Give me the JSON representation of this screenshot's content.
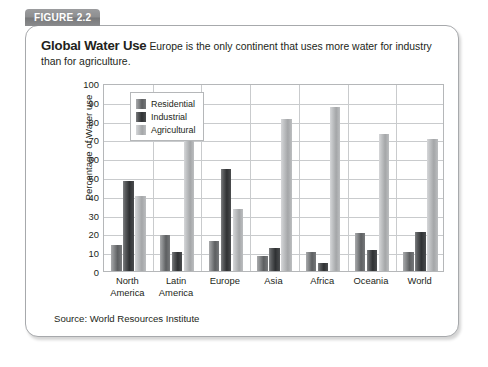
{
  "figure": {
    "tab_label": "FIGURE 2.2",
    "title": "Global Water Use",
    "description": "Europe is the only continent that uses more water for industry than for agriculture.",
    "source": "Source: World Resources Institute"
  },
  "colors": {
    "residential": "#6d6f71",
    "industrial": "#3a3c3e",
    "agricultural": "#b8babc",
    "card_border": "#a7a9ac",
    "tab_background": "#8a8b8d",
    "gridline": "#c9cbcd",
    "text": "#231f20"
  },
  "chart_data": {
    "type": "bar",
    "title": "Global Water Use",
    "xlabel": "",
    "ylabel": "Percentage of Water use",
    "ylim": [
      0,
      100
    ],
    "yticks": [
      0,
      10,
      20,
      30,
      40,
      50,
      60,
      70,
      80,
      90,
      100
    ],
    "grid": true,
    "legend_position": "top-left inside plot",
    "categories": [
      "North America",
      "Latin America",
      "Europe",
      "Asia",
      "Africa",
      "Oceania",
      "World"
    ],
    "category_lines": [
      [
        "North",
        "America"
      ],
      [
        "Latin",
        "America"
      ],
      [
        "Europe"
      ],
      [
        "Asia"
      ],
      [
        "Africa"
      ],
      [
        "Oceania"
      ],
      [
        "World"
      ]
    ],
    "series": [
      {
        "name": "Residential",
        "color": "#6d6f71",
        "values": [
          14,
          19,
          16,
          8,
          10,
          20,
          10
        ]
      },
      {
        "name": "Industrial",
        "color": "#3a3c3e",
        "values": [
          48,
          10,
          54,
          12,
          4,
          11,
          21
        ]
      },
      {
        "name": "Agricultural",
        "color": "#b8babc",
        "values": [
          40,
          72,
          33,
          81,
          87,
          73,
          70
        ]
      }
    ],
    "annotations": [
      "Source: World Resources Institute"
    ]
  }
}
